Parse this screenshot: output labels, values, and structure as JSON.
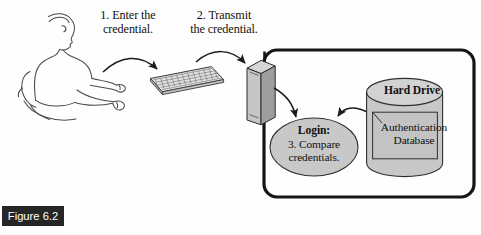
{
  "figure": {
    "caption": "Figure 6.2",
    "background_color": "#fefefe",
    "caption_bar_color": "#262626",
    "caption_text_color": "#ffffff"
  },
  "diagram": {
    "type": "authentication-flow",
    "line_color": "#1a1a1a",
    "fill_gray": "#c8c8c8",
    "fill_gray_dark": "#a9a9a9",
    "fill_gray_light": "#d8d8d8",
    "steps": [
      {
        "number": "1",
        "label": "1. Enter the\ncredential.",
        "from": "user",
        "to": "keyboard"
      },
      {
        "number": "2",
        "label": "2. Transmit\nthe credential.",
        "from": "keyboard",
        "to": "server"
      },
      {
        "number": "3",
        "label": "3. Compare\ncredentials.",
        "from": "server",
        "to": "login"
      }
    ],
    "nodes": {
      "user": {
        "name": "seated-person"
      },
      "keyboard": {
        "name": "keyboard"
      },
      "server": {
        "name": "server-tower"
      },
      "login": {
        "name": "login-process",
        "title": "Login:",
        "body": "3. Compare\ncredentials."
      },
      "hard_drive": {
        "name": "hard-drive-cylinder",
        "label": "Hard Drive"
      },
      "auth_db": {
        "name": "authentication-database",
        "label": "Authentication\nDatabase"
      }
    }
  }
}
